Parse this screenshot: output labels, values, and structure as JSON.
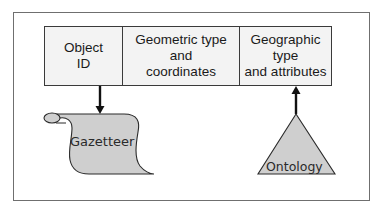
{
  "diagram": {
    "record": {
      "cells": [
        {
          "label": "Object\nID"
        },
        {
          "label": "Geometric type\nand\ncoordinates"
        },
        {
          "label": "Geographic\ntype\nand attributes"
        }
      ]
    },
    "gazetteer": {
      "label": "Gazetteer",
      "shape": "scroll",
      "fill": "#cfcfcf",
      "arrow_direction": "down"
    },
    "ontology": {
      "label": "Ontology",
      "shape": "triangle",
      "fill": "#cfcfcf",
      "arrow_direction": "up"
    },
    "colors": {
      "frame": "#6f6f6f",
      "table_fill": "#f3f3f3",
      "stroke": "#1a1a1a"
    }
  }
}
